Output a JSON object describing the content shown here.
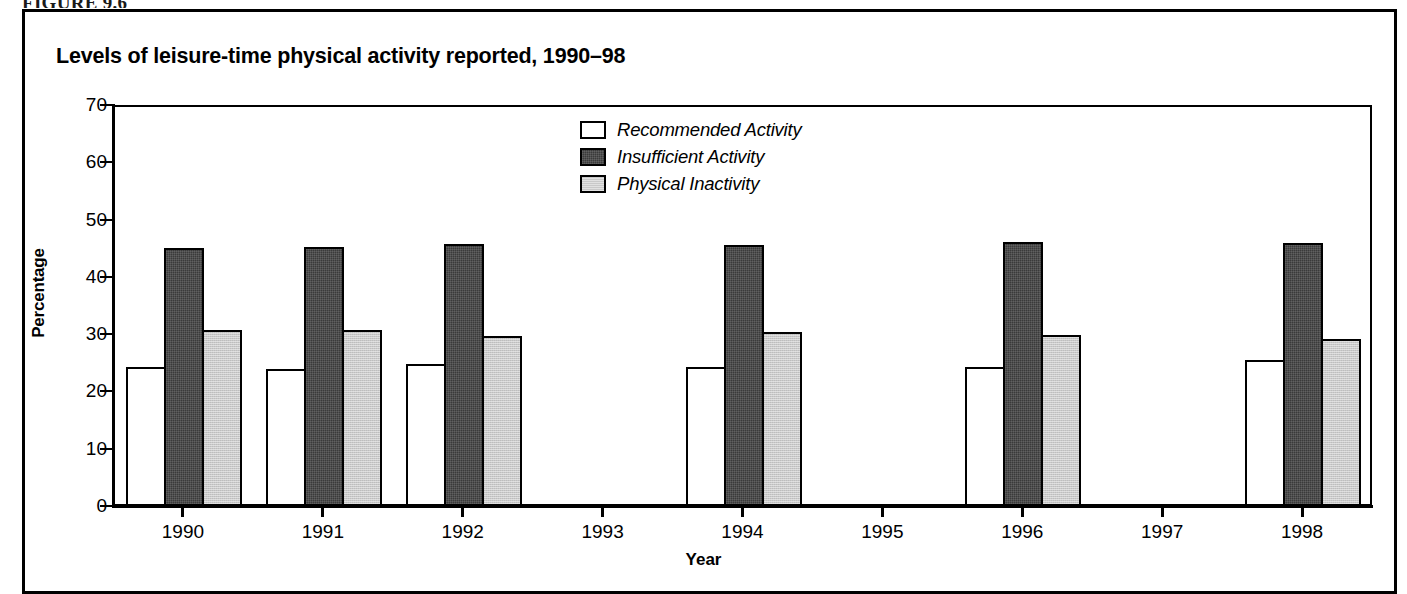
{
  "figure": {
    "caption": "FIGURE 9.6"
  },
  "chart_data": {
    "type": "bar",
    "title": "Levels of leisure-time physical activity reported, 1990–98",
    "xlabel": "Year",
    "ylabel": "Percentage",
    "ylim": [
      0,
      70
    ],
    "yticks": [
      0,
      10,
      20,
      30,
      40,
      50,
      60,
      70
    ],
    "ytick_labels": [
      "0",
      "10",
      "20",
      "30",
      "40",
      "50",
      "60",
      "70"
    ],
    "grid": false,
    "legend_position": "upper center",
    "categories": [
      "1990",
      "1991",
      "1992",
      "1993",
      "1994",
      "1995",
      "1996",
      "1997",
      "1998"
    ],
    "series": [
      {
        "name": "Recommended Activity",
        "color": "#ffffff",
        "edge_color": "#000000",
        "values": [
          24.3,
          24.0,
          24.8,
          null,
          24.3,
          null,
          24.3,
          null,
          25.5
        ]
      },
      {
        "name": "Insufficient Activity",
        "color": "#3a3a3a",
        "edge_color": "#000000",
        "values": [
          45.0,
          45.2,
          45.7,
          null,
          45.5,
          null,
          46.0,
          null,
          45.9
        ]
      },
      {
        "name": "Physical Inactivity",
        "color": "#c9c9c9",
        "edge_color": "#000000",
        "values": [
          30.8,
          30.8,
          29.6,
          null,
          30.3,
          null,
          29.9,
          null,
          29.1
        ]
      }
    ],
    "missing_categories": [
      "1993",
      "1995",
      "1997"
    ]
  }
}
